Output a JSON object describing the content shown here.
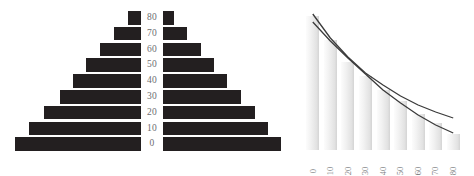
{
  "figure": {
    "background": "#ffffff",
    "bar_color_dark": "#231f20",
    "bar_color_light": "#e8e8e8",
    "label_color": "#6d6e71",
    "line_color": "#3b3b3b"
  },
  "pyramid": {
    "name": "population-pyramid",
    "age_labels": [
      "80",
      "70",
      "60",
      "50",
      "40",
      "30",
      "20",
      "10",
      "0"
    ],
    "chart_data": {
      "type": "bar",
      "orientation": "horizontal-diverging",
      "title": "",
      "xlabel": "",
      "ylabel": "",
      "categories": [
        "0",
        "10",
        "20",
        "30",
        "40",
        "50",
        "60",
        "70",
        "80"
      ],
      "series": [
        {
          "name": "left",
          "values": [
            126,
            112,
            97,
            81,
            68,
            55,
            41,
            27,
            13
          ]
        },
        {
          "name": "right",
          "values": [
            118,
            105,
            92,
            78,
            64,
            51,
            38,
            24,
            11
          ]
        }
      ],
      "grid": false,
      "legend": "none"
    }
  },
  "decline": {
    "name": "decline-chart",
    "chart_data": {
      "type": "bar",
      "title": "",
      "xlabel": "",
      "ylabel": "",
      "categories": [
        "0",
        "10",
        "20",
        "30",
        "40",
        "50",
        "60",
        "70",
        "80"
      ],
      "values": [
        134,
        110,
        88,
        74,
        60,
        49,
        36,
        27,
        16
      ],
      "ylim": [
        0,
        140
      ],
      "grid": false,
      "legend": "none",
      "tick_rotation": -90,
      "overlay_lines": [
        {
          "name": "line-upper",
          "points": [
            [
              0,
              136
            ],
            [
              10,
              112
            ],
            [
              20,
              93
            ],
            [
              30,
              77
            ],
            [
              40,
              65
            ],
            [
              50,
              54
            ],
            [
              60,
              45
            ],
            [
              70,
              38
            ],
            [
              80,
              32
            ]
          ]
        },
        {
          "name": "line-lower",
          "points": [
            [
              0,
              128
            ],
            [
              10,
              109
            ],
            [
              20,
              92
            ],
            [
              30,
              76
            ],
            [
              40,
              60
            ],
            [
              50,
              47
            ],
            [
              60,
              35
            ],
            [
              70,
              25
            ],
            [
              80,
              17
            ]
          ]
        }
      ]
    }
  }
}
